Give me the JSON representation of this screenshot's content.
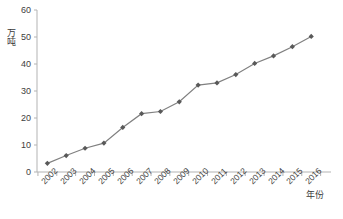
{
  "chart_data": {
    "type": "line",
    "title": "",
    "subtitle": "",
    "xlabel": "年份",
    "ylabel": "万吨",
    "categories": [
      "2002",
      "2003",
      "2004",
      "2005",
      "2006",
      "2007",
      "2008",
      "2009",
      "2010",
      "2011",
      "2012",
      "2013",
      "2014",
      "2015",
      "2016"
    ],
    "values": [
      3.2,
      6.1,
      8.8,
      10.7,
      16.5,
      21.6,
      22.4,
      26.0,
      32.2,
      33.0,
      36.1,
      40.2,
      43.0,
      46.4,
      50.2
    ],
    "series": [
      {
        "name": "",
        "values": [
          3.2,
          6.1,
          8.8,
          10.7,
          16.5,
          21.6,
          22.4,
          26.0,
          32.2,
          33.0,
          36.1,
          40.2,
          43.0,
          46.4,
          50.2
        ]
      }
    ],
    "ylim": [
      0,
      60
    ],
    "yticks": [
      0,
      10,
      20,
      30,
      40,
      50,
      60
    ],
    "ytick_labels": [
      "0",
      "10",
      "20",
      "30",
      "40",
      "50",
      "60"
    ],
    "xtick_labels": [
      "2002",
      "2003",
      "2004",
      "2005",
      "2006",
      "2007",
      "2008",
      "2009",
      "2010",
      "2011",
      "2012",
      "2013",
      "2014",
      "2015",
      "2016"
    ],
    "grid": false,
    "legend": false,
    "legend_position": "none",
    "marker": "diamond",
    "line_color": "#808080",
    "marker_color": "#595959",
    "axis_color": "#b3b3b3",
    "background_color": "#ffffff"
  }
}
